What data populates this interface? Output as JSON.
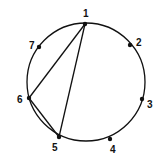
{
  "diagram": {
    "circle": {
      "cx": 86,
      "cy": 82,
      "r": 59,
      "stroke": "#111111"
    },
    "nodes": [
      {
        "id": "1",
        "label": "1",
        "x": 85,
        "y": 24,
        "lx": 83,
        "ly": 17
      },
      {
        "id": "2",
        "label": "2",
        "x": 130,
        "y": 45,
        "lx": 136,
        "ly": 46
      },
      {
        "id": "3",
        "label": "3",
        "x": 142,
        "y": 99,
        "lx": 147,
        "ly": 108
      },
      {
        "id": "4",
        "label": "4",
        "x": 110,
        "y": 139,
        "lx": 110,
        "ly": 153
      },
      {
        "id": "5",
        "label": "5",
        "x": 59,
        "y": 137,
        "lx": 52,
        "ly": 151
      },
      {
        "id": "6",
        "label": "6",
        "x": 29,
        "y": 98,
        "lx": 17,
        "ly": 103
      },
      {
        "id": "7",
        "label": "7",
        "x": 39,
        "y": 47,
        "lx": 29,
        "ly": 49
      }
    ],
    "edges": [
      {
        "from": "1",
        "to": "6"
      },
      {
        "from": "1",
        "to": "5"
      },
      {
        "from": "6",
        "to": "5"
      }
    ]
  }
}
